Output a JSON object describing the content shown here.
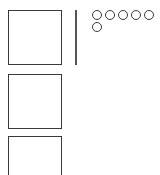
{
  "diagram": {
    "boxes": [
      {
        "id": "box-1"
      },
      {
        "id": "box-2"
      },
      {
        "id": "box-3"
      }
    ],
    "divider": {
      "orientation": "vertical"
    },
    "circles": {
      "count": 6,
      "rows": [
        5,
        1
      ]
    },
    "colors": {
      "stroke": "#3a3a3a",
      "divider": "#555555",
      "background": "#ffffff"
    }
  }
}
